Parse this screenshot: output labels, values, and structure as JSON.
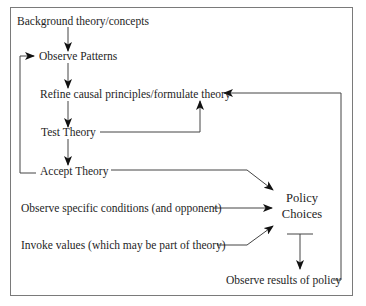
{
  "diagram": {
    "nodes": {
      "background": "Background theory/concepts",
      "observe_patterns": "Observe Patterns",
      "refine": "Refine causal principles/formulate theory",
      "test": "Test Theory",
      "accept": "Accept Theory",
      "observe_conditions": "Observe specific conditions (and opponent)",
      "invoke_values": "Invoke values (which may be part of theory)",
      "policy_line1": "Policy",
      "policy_line2": "Choices",
      "observe_results": "Observe results of policy"
    },
    "edges": [
      {
        "from": "background",
        "to": "observe_patterns"
      },
      {
        "from": "observe_patterns",
        "to": "refine"
      },
      {
        "from": "refine",
        "to": "test"
      },
      {
        "from": "test",
        "to": "accept"
      },
      {
        "from": "test",
        "to": "refine"
      },
      {
        "from": "accept",
        "to": "observe_patterns"
      },
      {
        "from": "accept",
        "to": "policy_choices"
      },
      {
        "from": "observe_conditions",
        "to": "policy_choices"
      },
      {
        "from": "invoke_values",
        "to": "policy_choices"
      },
      {
        "from": "policy_choices",
        "to": "observe_results"
      },
      {
        "from": "observe_results",
        "to": "refine"
      }
    ]
  }
}
